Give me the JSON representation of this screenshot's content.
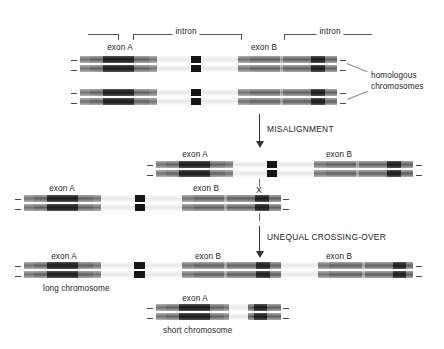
{
  "figure": {
    "topmost_bracket_labels": {
      "intron_left": "intron",
      "intron_right": "intron"
    },
    "step_labels": {
      "misalignment": "MISALIGNMENT",
      "crossing_over": "UNEQUAL CROSSING-OVER"
    },
    "annotations": {
      "homologous": "homologous",
      "chromosomes": "chromosomes",
      "crossover_mark": "X"
    }
  },
  "stage_top": {
    "name": "homologous chromosome pair",
    "exon_a": "exon A",
    "exon_b": "exon B",
    "intron_1": "intron",
    "intron_2": "intron",
    "side_note_line1": "homologous",
    "side_note_line2": "chromosomes"
  },
  "stage_middle": {
    "upper_chromosome": {
      "exon_a": "exon A",
      "exon_b": "exon B"
    },
    "lower_chromosome": {
      "exon_a": "exon A",
      "exon_b": "exon B"
    },
    "crossover_mark": "X"
  },
  "stage_bottom": {
    "long_chromosome": {
      "caption": "long chromosome",
      "exon_a": "exon A",
      "exon_b_first": "exon B",
      "exon_b_second": "exon B"
    },
    "short_chromosome": {
      "caption": "short chromosome",
      "exon_a": "exon A"
    }
  }
}
